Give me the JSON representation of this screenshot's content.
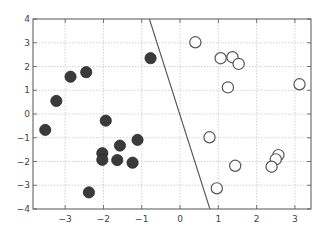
{
  "chart_data": {
    "type": "scatter",
    "title": "",
    "xlabel": "",
    "ylabel": "",
    "xlim": [
      -3.84,
      3.42
    ],
    "ylim": [
      -4,
      4
    ],
    "grid": true,
    "legend": null,
    "xticks": [
      -3,
      -2,
      -1,
      0,
      1,
      2,
      3
    ],
    "yticks": [
      -4,
      -3,
      -2,
      -1,
      0,
      1,
      2,
      3,
      4
    ],
    "xtick_labels": [
      "−3",
      "−2",
      "−1",
      "0",
      "1",
      "2",
      "3"
    ],
    "ytick_labels": [
      "−4",
      "−3",
      "−2",
      "−1",
      "0",
      "1",
      "2",
      "3",
      "4"
    ],
    "series": [
      {
        "name": "class A (filled)",
        "marker": "filled-circle",
        "color": "#3a3a3a",
        "points": [
          [
            -3.52,
            -0.67
          ],
          [
            -3.23,
            0.55
          ],
          [
            -2.86,
            1.57
          ],
          [
            -2.45,
            1.76
          ],
          [
            -0.77,
            2.35
          ],
          [
            -1.94,
            -0.28
          ],
          [
            -1.57,
            -1.33
          ],
          [
            -1.11,
            -1.09
          ],
          [
            -2.03,
            -1.65
          ],
          [
            -2.03,
            -1.93
          ],
          [
            -1.64,
            -1.94
          ],
          [
            -1.24,
            -2.05
          ],
          [
            -2.38,
            -3.3
          ]
        ]
      },
      {
        "name": "class B (open)",
        "marker": "open-circle",
        "color": "#555555",
        "points": [
          [
            0.4,
            3.02
          ],
          [
            1.06,
            2.35
          ],
          [
            1.37,
            2.39
          ],
          [
            1.53,
            2.11
          ],
          [
            1.25,
            1.12
          ],
          [
            3.12,
            1.25
          ],
          [
            0.77,
            -0.98
          ],
          [
            1.44,
            -2.18
          ],
          [
            2.57,
            -1.73
          ],
          [
            2.5,
            -1.91
          ],
          [
            2.39,
            -2.22
          ],
          [
            0.96,
            -3.13
          ]
        ]
      }
    ],
    "lines": [
      {
        "name": "decision boundary",
        "color": "#555555",
        "x": [
          -0.8,
          0.78
        ],
        "y": [
          4,
          -4
        ]
      }
    ]
  }
}
